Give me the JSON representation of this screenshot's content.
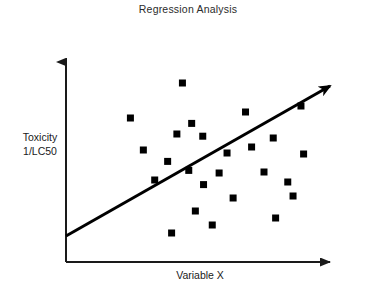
{
  "chart_data": {
    "type": "scatter",
    "title": "Regression Analysis",
    "xlabel": "Variable X",
    "ylabel_lines": [
      "Toxicity",
      "1/LC50"
    ],
    "ylabel": "Toxicity 1/LC50",
    "grid": false,
    "legend": null,
    "axis_ticks": false,
    "xlim": [
      0,
      100
    ],
    "ylim": [
      0,
      100
    ],
    "marker": {
      "shape": "square",
      "color": "#000000",
      "size_px": 7
    },
    "points": [
      {
        "x": 24.4,
        "y": 72.0
      },
      {
        "x": 29.3,
        "y": 56.0
      },
      {
        "x": 38.5,
        "y": 50.3
      },
      {
        "x": 42.0,
        "y": 64.0
      },
      {
        "x": 44.1,
        "y": 89.5
      },
      {
        "x": 47.6,
        "y": 69.3
      },
      {
        "x": 49.0,
        "y": 25.5
      },
      {
        "x": 51.8,
        "y": 62.9
      },
      {
        "x": 52.1,
        "y": 38.7
      },
      {
        "x": 55.4,
        "y": 18.5
      },
      {
        "x": 58.0,
        "y": 44.5
      },
      {
        "x": 63.3,
        "y": 32.0
      },
      {
        "x": 68.0,
        "y": 75.0
      },
      {
        "x": 70.3,
        "y": 57.5
      },
      {
        "x": 75.0,
        "y": 45.0
      },
      {
        "x": 78.5,
        "y": 62.0
      },
      {
        "x": 79.4,
        "y": 22.0
      },
      {
        "x": 84.0,
        "y": 40.0
      },
      {
        "x": 86.0,
        "y": 33.0
      },
      {
        "x": 89.0,
        "y": 78.0
      },
      {
        "x": 90.0,
        "y": 54.0
      },
      {
        "x": 33.6,
        "y": 41.0
      },
      {
        "x": 40.0,
        "y": 14.5
      },
      {
        "x": 46.5,
        "y": 45.8
      },
      {
        "x": 61.0,
        "y": 54.5
      }
    ],
    "regression_line": {
      "x0": 0,
      "y0": 13.0,
      "x1": 100,
      "y1": 88.0,
      "arrow": true,
      "color": "#000000",
      "width_px": 3
    },
    "axes": {
      "color": "#1a1a1a",
      "width_px": 2,
      "x_arrow": true,
      "y_arrow": true
    }
  }
}
